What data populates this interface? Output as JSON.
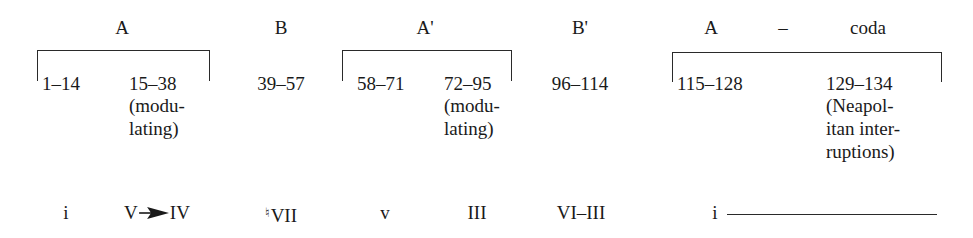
{
  "sections": [
    {
      "label": "A"
    },
    {
      "label": "B"
    },
    {
      "label": "A'"
    },
    {
      "label": "B'"
    },
    {
      "label": "A"
    },
    {
      "label": "–"
    },
    {
      "label": "coda"
    }
  ],
  "measures": [
    {
      "range": "1–14"
    },
    {
      "range": "15–38",
      "note": [
        "(modu-",
        "lating)"
      ]
    },
    {
      "range": "39–57"
    },
    {
      "range": "58–71"
    },
    {
      "range": "72–95",
      "note": [
        "(modu-",
        "lating)"
      ]
    },
    {
      "range": "96–114"
    },
    {
      "range": "115–128"
    },
    {
      "range": "129–134",
      "note": [
        "(Neapol-",
        "itan inter-",
        "ruptions)"
      ]
    }
  ],
  "keys": [
    {
      "label": "i"
    },
    {
      "from": "V",
      "to": "IV",
      "connector": "arrow-right-icon"
    },
    {
      "accidental": "♮",
      "label": "VII"
    },
    {
      "label": "v"
    },
    {
      "label": "III"
    },
    {
      "label": "VI–III"
    },
    {
      "label": "i",
      "extension": "continuation-line"
    }
  ],
  "brackets": [
    {
      "spans": "A",
      "covers": [
        "1–14",
        "15–38"
      ]
    },
    {
      "spans": "A'",
      "covers": [
        "58–71",
        "72–95"
      ]
    },
    {
      "spans": "A – coda",
      "covers": [
        "115–128",
        "129–134"
      ]
    }
  ]
}
